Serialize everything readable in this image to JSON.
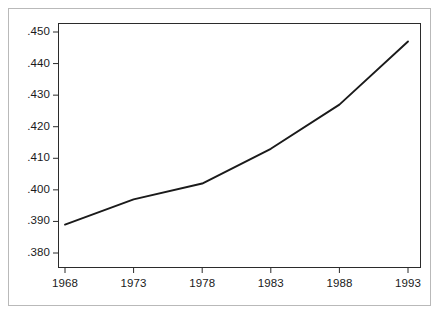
{
  "chart_data": {
    "type": "line",
    "title": "",
    "subtitle": "",
    "xlabel": "",
    "ylabel": "",
    "x": [
      1968,
      1973,
      1978,
      1983,
      1988,
      1993
    ],
    "categories": [
      "1968",
      "1973",
      "1978",
      "1983",
      "1988",
      "1993"
    ],
    "values": [
      0.389,
      0.397,
      0.402,
      0.413,
      0.427,
      0.447
    ],
    "series": [
      {
        "name": "",
        "values": [
          0.389,
          0.397,
          0.402,
          0.413,
          0.427,
          0.447
        ]
      }
    ],
    "point_labels": [
      ".389",
      ".397",
      ".402",
      ".413",
      ".427",
      ".447"
    ],
    "xlim": [
      1968,
      1993
    ],
    "ylim": [
      0.38,
      0.45
    ],
    "ytick_values": [
      0.45,
      0.44,
      0.43,
      0.42,
      0.41,
      0.4,
      0.39,
      0.38
    ],
    "ytick_labels": [
      ".450",
      ".440",
      ".430",
      ".420",
      ".410",
      ".400",
      ".390",
      ".380"
    ],
    "xtick_values": [
      1968,
      1973,
      1978,
      1983,
      1988,
      1993
    ],
    "xtick_labels": [
      "1968",
      "1973",
      "1978",
      "1983",
      "1988",
      "1993"
    ],
    "grid": false,
    "legend": false,
    "legend_position": "none",
    "annotations": [],
    "colors": {
      "line": "#1a1a1a",
      "axis": "#2b2b2b",
      "outer_frame": "#b9b9b9",
      "background": "#ffffff",
      "tick_label": "#1a1a1a"
    },
    "line_width": 1.9,
    "markers": "none"
  }
}
